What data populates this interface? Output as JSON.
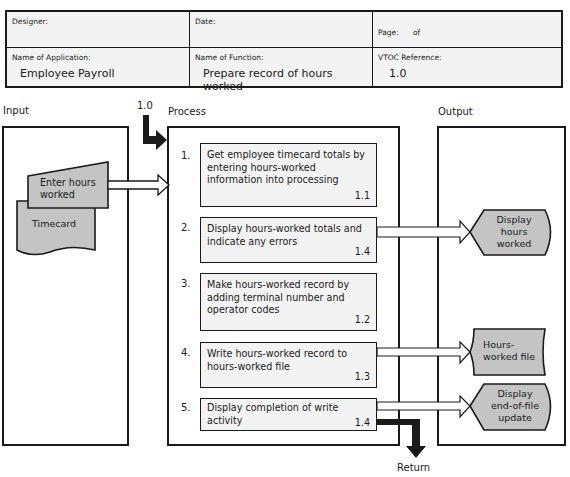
{
  "title": "HIPO Worksheet",
  "header": {
    "designer": {
      "label": "Designer:",
      "value": ""
    },
    "date": {
      "label": "Date:",
      "value": ""
    },
    "page": {
      "label": "Page:",
      "of_label": "of",
      "value": ""
    },
    "application": {
      "label": "Name of Application:",
      "value": "Employee Payroll"
    },
    "function": {
      "label": "Name of Function:",
      "value": "Prepare record of hours worked"
    },
    "vtoc": {
      "label": "VTOC Reference:",
      "value": "1.0"
    }
  },
  "sections": {
    "input": "Input",
    "process": "Process",
    "output": "Output"
  },
  "entry_ref": "1.0",
  "return_label": "Return",
  "inputs": [
    {
      "label": "Enter hours worked",
      "shape": "manual-input"
    },
    {
      "label": "Timecard",
      "shape": "document"
    }
  ],
  "steps": [
    {
      "num": "1.",
      "text": "Get employee timecard totals by entering hours-worked information into processing",
      "ref": "1.1"
    },
    {
      "num": "2.",
      "text": "Display hours-worked totals and indicate any errors",
      "ref": "1.4"
    },
    {
      "num": "3.",
      "text": "Make hours-worked record by adding terminal number and operator codes",
      "ref": "1.2"
    },
    {
      "num": "4.",
      "text": "Write hours-worked record to hours-worked file",
      "ref": "1.3"
    },
    {
      "num": "5.",
      "text": "Display completion of write activity",
      "ref": "1.4"
    }
  ],
  "outputs": [
    {
      "label": "Display hours worked",
      "shape": "display"
    },
    {
      "label": "Hours-worked file",
      "shape": "stored-data"
    },
    {
      "label": "Display end-of-file update",
      "shape": "display"
    }
  ],
  "colors": {
    "fill": "#c4c4c4",
    "line": "#1a1a1a",
    "box": "#f3f3f3"
  }
}
